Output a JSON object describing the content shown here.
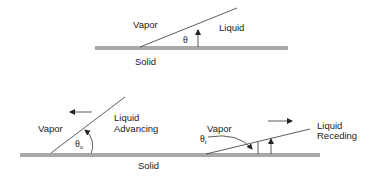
{
  "top_diagram": {
    "vapor_label": "Vapor",
    "liquid_label": "Liquid",
    "solid_label": "Solid",
    "angle_symbol": "θ",
    "angle_subscript": ""
  },
  "advancing_diagram": {
    "vapor_label": "Vapor",
    "liquid_label_line1": "Liquid",
    "liquid_label_line2": "Advancing",
    "angle_symbol": "θ",
    "angle_subscript": "a",
    "motion_direction": "left"
  },
  "receding_diagram": {
    "vapor_label": "Vapor",
    "liquid_label_line1": "Liquid",
    "liquid_label_line2": "Receding",
    "angle_symbol": "θ",
    "angle_subscript": "r",
    "motion_direction": "right"
  },
  "bottom_solid_label": "Solid",
  "colors": {
    "line": "#333333",
    "solid_fill": "#a8a8a8",
    "text": "#222222"
  }
}
